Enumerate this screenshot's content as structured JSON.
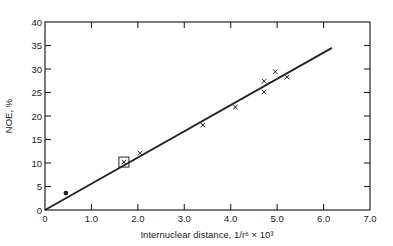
{
  "chart_data": {
    "type": "scatter",
    "title": "",
    "xlabel": "Internuclear distance, 1/r⁶ × 10³",
    "ylabel": "NOE, %",
    "xlim": [
      0,
      7.0
    ],
    "ylim": [
      0,
      40
    ],
    "grid": false,
    "legend": null,
    "x_ticks": [
      "0",
      "1.0",
      "2.0",
      "3.0",
      "4.0",
      "5.0",
      "6.0",
      "7.0"
    ],
    "y_ticks": [
      "0",
      "5",
      "10",
      "15",
      "20",
      "25",
      "30",
      "35",
      "40"
    ],
    "series": [
      {
        "name": "cross-points",
        "marker": "x",
        "points": [
          {
            "x": 1.7,
            "y": 10.2
          },
          {
            "x": 2.05,
            "y": 12.1
          },
          {
            "x": 3.4,
            "y": 18.1
          },
          {
            "x": 4.1,
            "y": 21.9
          },
          {
            "x": 4.72,
            "y": 27.4
          },
          {
            "x": 4.72,
            "y": 25.1
          },
          {
            "x": 4.96,
            "y": 29.4
          },
          {
            "x": 5.21,
            "y": 28.3
          }
        ]
      },
      {
        "name": "filled-point",
        "marker": "dot",
        "points": [
          {
            "x": 0.45,
            "y": 3.6
          }
        ]
      },
      {
        "name": "boxed-point",
        "marker": "square",
        "points": [
          {
            "x": 1.7,
            "y": 10.2
          }
        ]
      },
      {
        "name": "fit-line",
        "type": "line",
        "points": [
          {
            "x": 0,
            "y": 0
          },
          {
            "x": 6.18,
            "y": 34.5
          }
        ]
      }
    ]
  }
}
